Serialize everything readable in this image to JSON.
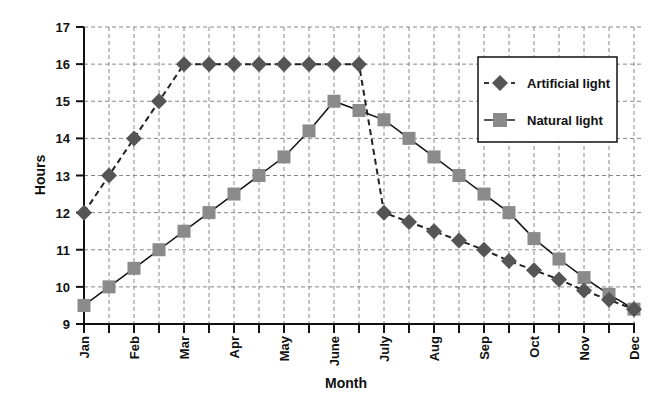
{
  "chart_data": {
    "type": "line",
    "title": "",
    "xlabel": "Month",
    "ylabel": "Hours",
    "ylim": [
      9,
      17
    ],
    "yticks": [
      9,
      10,
      11,
      12,
      13,
      14,
      15,
      16,
      17
    ],
    "grid": true,
    "legend_position": "upper right",
    "month_labels": [
      "Jan",
      "Feb",
      "Mar",
      "Apr",
      "May",
      "June",
      "July",
      "Aug",
      "Sep",
      "Oct",
      "Nov",
      "Dec"
    ],
    "x": [
      1,
      1.5,
      2,
      2.5,
      3,
      3.5,
      4,
      4.5,
      5,
      5.5,
      6,
      6.5,
      7,
      7.5,
      8,
      8.5,
      9,
      9.5,
      10,
      10.5,
      11,
      11.5,
      12
    ],
    "series": [
      {
        "name": "Artificial light",
        "style": "dashed",
        "marker": "diamond",
        "color": "#555555",
        "values": [
          12,
          13,
          14,
          15,
          16,
          16,
          16,
          16,
          16,
          16,
          16,
          16,
          12,
          11.75,
          11.5,
          11.25,
          11,
          10.7,
          10.45,
          10.2,
          9.9,
          9.65,
          9.4
        ]
      },
      {
        "name": "Natural light",
        "style": "solid",
        "marker": "square",
        "color": "#8a8a8a",
        "values": [
          9.5,
          10,
          10.5,
          11,
          11.5,
          12,
          12.5,
          13,
          13.5,
          14.2,
          15,
          14.75,
          14.5,
          14,
          13.5,
          13,
          12.5,
          12,
          11.3,
          10.75,
          10.25,
          9.8,
          9.4
        ]
      }
    ]
  }
}
